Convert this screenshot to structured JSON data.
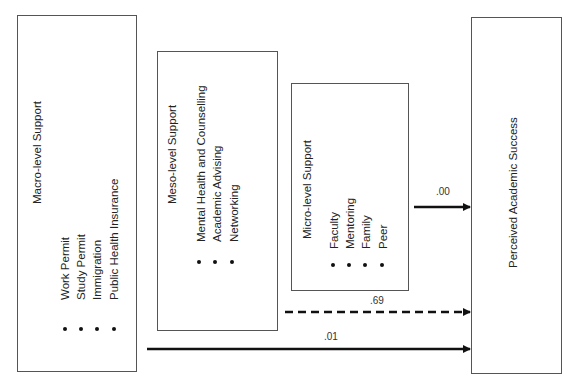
{
  "diagram": {
    "nodes": {
      "macro": {
        "title": "Macro-level Support",
        "items": [
          "Work Permit",
          "Study Permit",
          "Immigration",
          "Public Health Insurance"
        ]
      },
      "meso": {
        "title": "Meso-level Support",
        "items": [
          "Mental Health and Counselling",
          "Academic Advising",
          "Networking"
        ]
      },
      "micro": {
        "title": "Micro-level Support",
        "items": [
          "Faculty",
          "Mentoring",
          "Family",
          "Peer"
        ]
      },
      "outcome": {
        "title": "Perceived Academic Success"
      }
    },
    "edges": [
      {
        "from": "micro",
        "to": "outcome",
        "label": ".00",
        "style": "solid"
      },
      {
        "from": "meso",
        "to": "outcome",
        "label": ".69",
        "style": "dashed"
      },
      {
        "from": "macro",
        "to": "outcome",
        "label": ".01",
        "style": "solid"
      }
    ]
  }
}
